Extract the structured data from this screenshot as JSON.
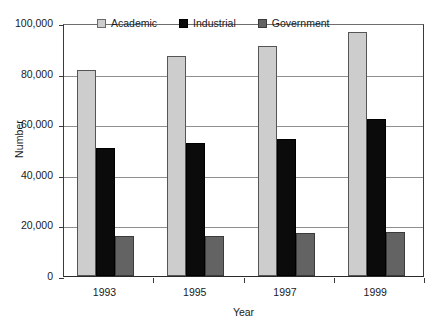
{
  "chart_data": {
    "type": "bar",
    "title": "",
    "xlabel": "Year",
    "ylabel": "Number",
    "categories": [
      "1993",
      "1995",
      "1997",
      "1999"
    ],
    "series": [
      {
        "name": "Academic",
        "color": "#cdcdcd",
        "values": [
          81500,
          87000,
          91000,
          96500
        ]
      },
      {
        "name": "Industrial",
        "color": "#0b0b0b",
        "values": [
          50500,
          52500,
          54000,
          62000
        ]
      },
      {
        "name": "Government",
        "color": "#636363",
        "values": [
          16000,
          16000,
          17000,
          17500
        ]
      }
    ],
    "ylim": [
      0,
      100000
    ],
    "ytick_labels": [
      "100,000",
      "80,000",
      "60,000",
      "40,000",
      "20,000",
      "0"
    ],
    "ytick_values": [
      100000,
      80000,
      60000,
      40000,
      20000,
      0
    ],
    "grid": true,
    "legend_position": "top-inside"
  },
  "axes": {
    "y_title": "Number",
    "x_title": "Year"
  },
  "legend": {
    "items": [
      {
        "label": "Academic",
        "swatch": "academic-swatch"
      },
      {
        "label": "Industrial",
        "swatch": "industrial-swatch"
      },
      {
        "label": "Government",
        "swatch": "government-swatch"
      }
    ]
  }
}
